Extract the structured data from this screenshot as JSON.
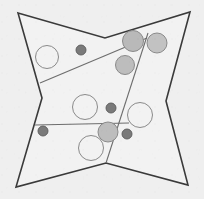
{
  "figure": {
    "background_color": "#efefef",
    "canvas": {
      "width": 204,
      "height": 199
    }
  },
  "star": {
    "name": "four-pointed-star-outline",
    "stroke_color": "#3a3a3a",
    "fill_color": "#f2f2f2",
    "stroke_width": 1.6,
    "points": "18,13 105,38 190,12 166,101 188,185 106,163 16,187 42,98"
  },
  "partitions": [
    {
      "name": "upper-diagonal-divider",
      "x1": 40,
      "y1": 83,
      "x2": 147,
      "y2": 38,
      "stroke_color": "#6d6d6d",
      "stroke_width": 1.1
    },
    {
      "name": "steep-vertical-divider",
      "x1": 148,
      "y1": 33,
      "x2": 106,
      "y2": 163,
      "stroke_color": "#6d6d6d",
      "stroke_width": 1.1
    },
    {
      "name": "lower-horizontal-divider",
      "x1": 35,
      "y1": 125,
      "x2": 129,
      "y2": 123,
      "stroke_color": "#6d6d6d",
      "stroke_width": 1.1
    }
  ],
  "circles": [
    {
      "name": "open-circle-upper-left",
      "cx": 47,
      "cy": 57,
      "r": 11.5,
      "fill": "none",
      "stroke": "#8a8a8a",
      "stroke_width": 1.0
    },
    {
      "name": "dark-dot-upper-left",
      "cx": 81,
      "cy": 50,
      "r": 5.0,
      "fill": "#7a7a7a",
      "stroke": "#5a5a5a",
      "stroke_width": 0.9
    },
    {
      "name": "gray-circle-top-notch",
      "cx": 133,
      "cy": 41,
      "r": 10.5,
      "fill": "#b9b9b9",
      "stroke": "#8a8a8a",
      "stroke_width": 1.0
    },
    {
      "name": "gray-circle-top-right",
      "cx": 157,
      "cy": 43,
      "r": 10.0,
      "fill": "#c2c2c2",
      "stroke": "#8a8a8a",
      "stroke_width": 1.0
    },
    {
      "name": "gray-circle-mid-right",
      "cx": 125,
      "cy": 65,
      "r": 9.5,
      "fill": "#bdbdbd",
      "stroke": "#8a8a8a",
      "stroke_width": 1.0
    },
    {
      "name": "open-circle-center",
      "cx": 85,
      "cy": 107,
      "r": 12.5,
      "fill": "none",
      "stroke": "#8a8a8a",
      "stroke_width": 1.0
    },
    {
      "name": "dark-dot-center-right",
      "cx": 111,
      "cy": 108,
      "r": 5.0,
      "fill": "#7a7a7a",
      "stroke": "#5a5a5a",
      "stroke_width": 0.9
    },
    {
      "name": "open-circle-right",
      "cx": 140,
      "cy": 115,
      "r": 12.5,
      "fill": "none",
      "stroke": "#8a8a8a",
      "stroke_width": 1.0
    },
    {
      "name": "dark-dot-lower-left",
      "cx": 43,
      "cy": 131,
      "r": 5.0,
      "fill": "#7a7a7a",
      "stroke": "#5a5a5a",
      "stroke_width": 0.9
    },
    {
      "name": "gray-circle-lower-center",
      "cx": 108,
      "cy": 132,
      "r": 10.0,
      "fill": "#bdbdbd",
      "stroke": "#8a8a8a",
      "stroke_width": 1.0
    },
    {
      "name": "dark-dot-lower-right",
      "cx": 127,
      "cy": 134,
      "r": 5.0,
      "fill": "#7a7a7a",
      "stroke": "#5a5a5a",
      "stroke_width": 0.9
    },
    {
      "name": "open-circle-bottom",
      "cx": 91,
      "cy": 148,
      "r": 12.5,
      "fill": "none",
      "stroke": "#8a8a8a",
      "stroke_width": 1.0
    }
  ]
}
